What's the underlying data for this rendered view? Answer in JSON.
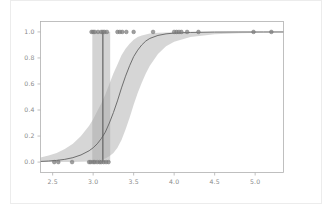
{
  "figure": {
    "background_color": "#ffffff",
    "outer_frame_color": "#ececec",
    "axes_frame_color": "#b0b0b0",
    "tick_label_color": "#8a8a8a"
  },
  "chart_data": {
    "type": "line",
    "title": "",
    "subtitle": "",
    "xlabel": "",
    "ylabel": "",
    "xlim": [
      2.35,
      5.35
    ],
    "ylim": [
      -0.08,
      1.08
    ],
    "grid": false,
    "legend": null,
    "xticks": [
      2.5,
      3.0,
      3.5,
      4.0,
      4.5,
      5.0
    ],
    "xtick_labels": [
      "2.5",
      "3.0",
      "3.5",
      "4.0",
      "4.5",
      "5.0"
    ],
    "yticks": [
      0.0,
      0.2,
      0.4,
      0.6,
      0.8,
      1.0
    ],
    "ytick_labels": [
      "0.0",
      "0.2",
      "0.4",
      "0.6",
      "0.8",
      "1.0"
    ],
    "series": [
      {
        "name": "fitted-logistic-curve",
        "type": "line",
        "color": "#6e6e6e",
        "linewidth": 1.0,
        "x": [
          2.35,
          2.45,
          2.55,
          2.65,
          2.75,
          2.85,
          2.95,
          3.0,
          3.05,
          3.1,
          3.15,
          3.2,
          3.25,
          3.3,
          3.35,
          3.4,
          3.45,
          3.5,
          3.55,
          3.6,
          3.65,
          3.7,
          3.8,
          3.9,
          4.0,
          4.2,
          4.5,
          4.8,
          5.1,
          5.35
        ],
        "y": [
          0.005,
          0.008,
          0.013,
          0.021,
          0.034,
          0.055,
          0.087,
          0.11,
          0.14,
          0.18,
          0.23,
          0.3,
          0.38,
          0.47,
          0.57,
          0.66,
          0.74,
          0.81,
          0.86,
          0.9,
          0.93,
          0.95,
          0.973,
          0.985,
          0.991,
          0.996,
          0.999,
          0.9995,
          0.9998,
          0.9999
        ]
      },
      {
        "name": "confidence-band",
        "type": "band",
        "color": "#b5b5b5",
        "opacity": 0.55,
        "x": [
          2.35,
          2.45,
          2.55,
          2.65,
          2.75,
          2.85,
          2.95,
          3.0,
          3.05,
          3.1,
          3.15,
          3.2,
          3.25,
          3.3,
          3.35,
          3.4,
          3.45,
          3.5,
          3.55,
          3.6,
          3.65,
          3.7,
          3.8,
          3.9,
          4.0,
          4.2,
          4.5,
          4.8,
          5.1,
          5.35
        ],
        "y_lower": [
          0.0,
          0.0,
          0.0,
          0.0,
          0.001,
          0.002,
          0.005,
          0.008,
          0.012,
          0.018,
          0.028,
          0.045,
          0.07,
          0.11,
          0.17,
          0.25,
          0.34,
          0.44,
          0.53,
          0.61,
          0.68,
          0.74,
          0.83,
          0.89,
          0.925,
          0.96,
          0.982,
          0.99,
          0.994,
          0.996
        ],
        "y_upper": [
          0.035,
          0.05,
          0.07,
          0.1,
          0.14,
          0.2,
          0.28,
          0.33,
          0.39,
          0.45,
          0.52,
          0.6,
          0.68,
          0.75,
          0.82,
          0.87,
          0.91,
          0.94,
          0.96,
          0.973,
          0.981,
          0.987,
          0.993,
          0.996,
          0.998,
          0.999,
          1.0,
          1.0,
          1.0,
          1.0
        ]
      },
      {
        "name": "threshold-line",
        "type": "vline",
        "color": "#5a5a5a",
        "linewidth": 1.1,
        "x": 3.12,
        "y_range": [
          0.0,
          1.0
        ]
      },
      {
        "name": "threshold-confidence-band",
        "type": "vband",
        "color": "#a8a8a8",
        "opacity": 0.5,
        "x_range": [
          2.99,
          3.21
        ],
        "y_range": [
          0.0,
          1.0
        ]
      },
      {
        "name": "observations-negative",
        "type": "scatter",
        "color": "#808080",
        "marker": "circle",
        "size": 3,
        "x": [
          2.52,
          2.57,
          2.74,
          2.95,
          2.97,
          3.0,
          3.02,
          3.05,
          3.08,
          3.1,
          3.13,
          3.16,
          3.19
        ],
        "y": [
          0.0,
          0.0,
          0.0,
          0.0,
          0.0,
          0.0,
          0.0,
          0.0,
          0.0,
          0.0,
          0.0,
          0.0,
          0.0
        ]
      },
      {
        "name": "observations-positive",
        "type": "scatter",
        "color": "#808080",
        "marker": "circle",
        "size": 3,
        "x": [
          2.98,
          3.0,
          3.02,
          3.06,
          3.1,
          3.12,
          3.14,
          3.17,
          3.3,
          3.33,
          3.36,
          3.41,
          3.5,
          3.74,
          4.0,
          4.03,
          4.06,
          4.09,
          4.16,
          4.3,
          4.98,
          5.2
        ],
        "y": [
          1.0,
          1.0,
          1.0,
          1.0,
          1.0,
          1.0,
          1.0,
          1.0,
          1.0,
          1.0,
          1.0,
          1.0,
          1.0,
          1.0,
          1.0,
          1.0,
          1.0,
          1.0,
          1.0,
          1.0,
          1.0,
          1.0
        ]
      }
    ]
  }
}
